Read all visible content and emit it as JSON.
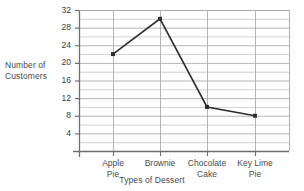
{
  "chart_data": {
    "type": "line",
    "title": "",
    "xlabel": "Types of Dessert",
    "ylabel": "Number of Customers",
    "categories": [
      "Apple Pie",
      "Brownie",
      "Chocolate Cake",
      "Key Lime Pie"
    ],
    "values": [
      22,
      30,
      10,
      8
    ],
    "series": [
      {
        "name": "Number of Customers",
        "values": [
          22,
          30,
          10,
          8
        ]
      }
    ],
    "ylim": [
      0,
      32
    ],
    "ytick_labels": [
      "32",
      "28",
      "24",
      "20",
      "16",
      "12",
      "8",
      "4"
    ],
    "ytick_values": [
      32,
      28,
      24,
      20,
      16,
      12,
      8,
      4
    ],
    "ytick_step": 4,
    "minor_gridline_step": 2,
    "grid": true,
    "legend": "none",
    "line_color": "#2e2e2e",
    "grid_color": "#a9a9a9",
    "axis_color": "#6e6e6e",
    "marker": "square"
  },
  "axis_titles": {
    "y_line1": "Number of",
    "y_line2": "Customers",
    "x": "Types of Dessert"
  },
  "category_labels": [
    {
      "line1": "Apple",
      "line2": "Pie"
    },
    {
      "line1": "Brownie",
      "line2": ""
    },
    {
      "line1": "Chocolate",
      "line2": "Cake"
    },
    {
      "line1": "Key Lime",
      "line2": "Pie"
    }
  ]
}
